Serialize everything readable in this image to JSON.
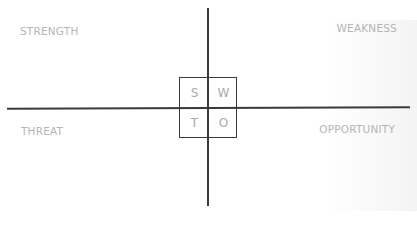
{
  "diagram": {
    "type": "SWOT quadrant",
    "quadrants": {
      "top_left": "STRENGTH",
      "top_right": "WEAKNESS",
      "bottom_left": "THREAT",
      "bottom_right": "OPPORTUNITY"
    },
    "center_grid": {
      "s": "S",
      "w": "W",
      "t": "T",
      "o": "O"
    },
    "colors": {
      "line": "#3a3a3a",
      "label": "#b5b5b5",
      "letter": "#aaaaaa"
    }
  }
}
